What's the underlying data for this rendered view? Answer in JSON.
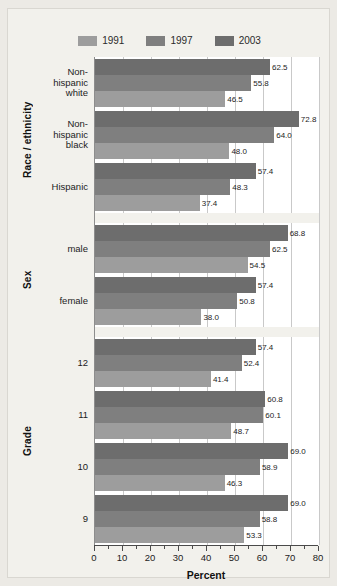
{
  "chart_data": {
    "type": "bar",
    "orientation": "horizontal",
    "title": "",
    "xlabel": "Percent",
    "ylabel": "",
    "xlim": [
      0,
      80
    ],
    "xticks": [
      0,
      10,
      20,
      30,
      40,
      50,
      60,
      70,
      80
    ],
    "xtick_labels": [
      "0",
      "10",
      "20",
      "30",
      "40",
      "50",
      "60",
      "70",
      "80"
    ],
    "minor_tick_step": 5,
    "grid": true,
    "grid_axis": "x",
    "legend_position": "top-center",
    "legend": [
      "1991",
      "1997",
      "2003"
    ],
    "series": [
      {
        "name": "1991",
        "color": "#9d9d9d",
        "values": [
          46.5,
          48.0,
          37.4,
          54.5,
          38.0,
          41.4,
          48.7,
          46.3,
          53.3
        ]
      },
      {
        "name": "1997",
        "color": "#7f7f7f",
        "values": [
          55.8,
          64.0,
          48.3,
          62.5,
          50.8,
          52.4,
          60.1,
          58.9,
          58.8
        ]
      },
      {
        "name": "2003",
        "color": "#6d6d6d",
        "values": [
          62.5,
          72.8,
          57.4,
          68.8,
          57.4,
          57.4,
          60.8,
          69.0,
          69.0
        ]
      }
    ],
    "categories": [
      "Non-hispanic white",
      "Non-hispanic black",
      "Hispanic",
      "male",
      "female",
      "12",
      "11",
      "10",
      "9"
    ],
    "category_groups": [
      {
        "title": "Race / ethnicity",
        "categories": [
          {
            "label_lines": [
              "Non-",
              "hispanic",
              "white"
            ],
            "bars": [
              {
                "series": "2003",
                "value": 62.5,
                "label": "62.5"
              },
              {
                "series": "1997",
                "value": 55.8,
                "label": "55.8"
              },
              {
                "series": "1991",
                "value": 46.5,
                "label": "46.5"
              }
            ]
          },
          {
            "label_lines": [
              "Non-",
              "hispanic",
              "black"
            ],
            "bars": [
              {
                "series": "2003",
                "value": 72.8,
                "label": "72.8"
              },
              {
                "series": "1997",
                "value": 64.0,
                "label": "64.0"
              },
              {
                "series": "1991",
                "value": 48.0,
                "label": "48.0"
              }
            ]
          },
          {
            "label_lines": [
              "Hispanic"
            ],
            "bars": [
              {
                "series": "2003",
                "value": 57.4,
                "label": "57.4"
              },
              {
                "series": "1997",
                "value": 48.3,
                "label": "48.3"
              },
              {
                "series": "1991",
                "value": 37.4,
                "label": "37.4"
              }
            ]
          }
        ]
      },
      {
        "title": "Sex",
        "categories": [
          {
            "label_lines": [
              "male"
            ],
            "bars": [
              {
                "series": "2003",
                "value": 68.8,
                "label": "68.8"
              },
              {
                "series": "1997",
                "value": 62.5,
                "label": "62.5"
              },
              {
                "series": "1991",
                "value": 54.5,
                "label": "54.5"
              }
            ]
          },
          {
            "label_lines": [
              "female"
            ],
            "bars": [
              {
                "series": "2003",
                "value": 57.4,
                "label": "57.4"
              },
              {
                "series": "1997",
                "value": 50.8,
                "label": "50.8"
              },
              {
                "series": "1991",
                "value": 38.0,
                "label": "38.0"
              }
            ]
          }
        ]
      },
      {
        "title": "Grade",
        "categories": [
          {
            "label_lines": [
              "12"
            ],
            "bars": [
              {
                "series": "2003",
                "value": 57.4,
                "label": "57.4"
              },
              {
                "series": "1997",
                "value": 52.4,
                "label": "52.4"
              },
              {
                "series": "1991",
                "value": 41.4,
                "label": "41.4"
              }
            ]
          },
          {
            "label_lines": [
              "11"
            ],
            "bars": [
              {
                "series": "2003",
                "value": 60.8,
                "label": "60.8"
              },
              {
                "series": "1997",
                "value": 60.1,
                "label": "60.1"
              },
              {
                "series": "1991",
                "value": 48.7,
                "label": "48.7"
              }
            ]
          },
          {
            "label_lines": [
              "10"
            ],
            "bars": [
              {
                "series": "2003",
                "value": 69.0,
                "label": "69.0"
              },
              {
                "series": "1997",
                "value": 58.9,
                "label": "58.9"
              },
              {
                "series": "1991",
                "value": 46.3,
                "label": "46.3"
              }
            ]
          },
          {
            "label_lines": [
              "9"
            ],
            "bars": [
              {
                "series": "2003",
                "value": 69.0,
                "label": "69.0"
              },
              {
                "series": "1997",
                "value": 58.8,
                "label": "58.8"
              },
              {
                "series": "1991",
                "value": 53.3,
                "label": "53.3"
              }
            ]
          }
        ]
      }
    ]
  },
  "colors": {
    "series_1991": "#9d9d9d",
    "series_1997": "#7f7f7f",
    "series_2003": "#6d6d6d",
    "plot_background": "#ffffff",
    "figure_background": "#f2f1ec",
    "gridline": "#c9c9c9",
    "axis": "#4a4a4a",
    "text": "#1c1c1c"
  }
}
